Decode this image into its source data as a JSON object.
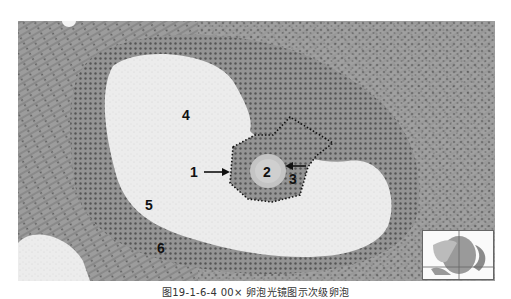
{
  "figure": {
    "labels": {
      "l1": "1",
      "l2": "2",
      "l3": "3",
      "l4": "4",
      "l5": "5",
      "l6": "6"
    },
    "caption": "图19-1-6-4  00×  卵泡光镜图示次级卵泡",
    "colors": {
      "tissue_dark": "#7a7a7a",
      "tissue_mid": "#9a9a9a",
      "antrum": "#ececec",
      "oocyte": "#c8c8c8",
      "outline": "#111111"
    }
  }
}
